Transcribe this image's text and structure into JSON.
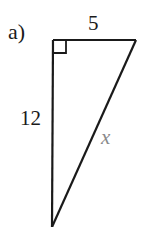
{
  "figure": {
    "part_label": "a)",
    "triangle": {
      "type": "right-triangle",
      "right_angle_marker": true,
      "sides": {
        "top": {
          "label": "5",
          "length": 5
        },
        "left": {
          "label": "12",
          "length": 12
        },
        "hypotenuse": {
          "label": "x",
          "unknown": true
        }
      },
      "stroke_color": "#1a1a1a",
      "unknown_label_color": "#8a8a8a"
    }
  }
}
